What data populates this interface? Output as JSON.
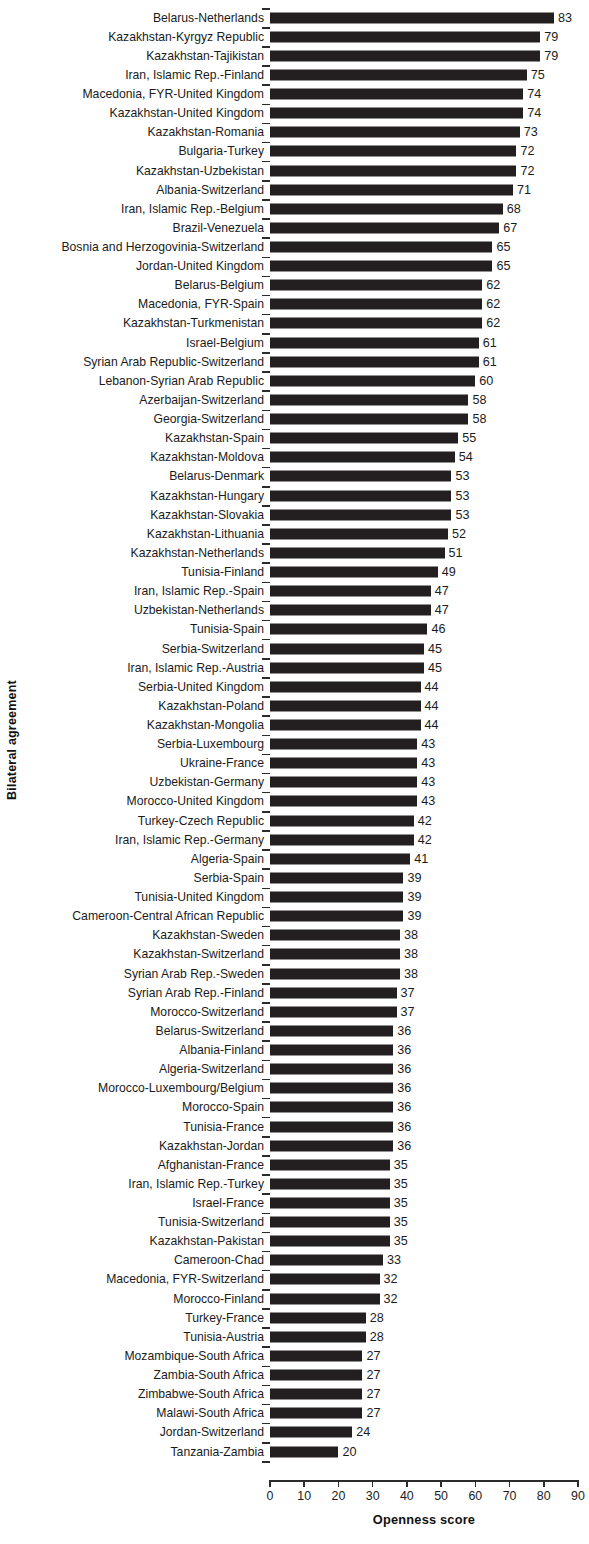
{
  "chart_data": {
    "type": "bar",
    "orientation": "horizontal",
    "title": "",
    "xlabel": "Openness score",
    "ylabel": "Bilateral agreement",
    "xlim": [
      0,
      90
    ],
    "xticks": [
      0,
      10,
      20,
      30,
      40,
      50,
      60,
      70,
      80,
      90
    ],
    "grid": false,
    "legend": null,
    "bar_color": "#231f20",
    "data_labels": true,
    "categories": [
      "Belarus-Netherlands",
      "Kazakhstan-Kyrgyz Republic",
      "Kazakhstan-Tajikistan",
      "Iran, Islamic Rep.-Finland",
      "Macedonia, FYR-United Kingdom",
      "Kazakhstan-United Kingdom",
      "Kazakhstan-Romania",
      "Bulgaria-Turkey",
      "Kazakhstan-Uzbekistan",
      "Albania-Switzerland",
      "Iran, Islamic Rep.-Belgium",
      "Brazil-Venezuela",
      "Bosnia and Herzogovinia-Switzerland",
      "Jordan-United Kingdom",
      "Belarus-Belgium",
      "Macedonia, FYR-Spain",
      "Kazakhstan-Turkmenistan",
      "Israel-Belgium",
      "Syrian Arab Republic-Switzerland",
      "Lebanon-Syrian Arab Republic",
      "Azerbaijan-Switzerland",
      "Georgia-Switzerland",
      "Kazakhstan-Spain",
      "Kazakhstan-Moldova",
      "Belarus-Denmark",
      "Kazakhstan-Hungary",
      "Kazakhstan-Slovakia",
      "Kazakhstan-Lithuania",
      "Kazakhstan-Netherlands",
      "Tunisia-Finland",
      "Iran, Islamic Rep.-Spain",
      "Uzbekistan-Netherlands",
      "Tunisia-Spain",
      "Serbia-Switzerland",
      "Iran, Islamic Rep.-Austria",
      "Serbia-United Kingdom",
      "Kazakhstan-Poland",
      "Kazakhstan-Mongolia",
      "Serbia-Luxembourg",
      "Ukraine-France",
      "Uzbekistan-Germany",
      "Morocco-United Kingdom",
      "Turkey-Czech Republic",
      "Iran, Islamic Rep.-Germany",
      "Algeria-Spain",
      "Serbia-Spain",
      "Tunisia-United Kingdom",
      "Cameroon-Central African Republic",
      "Kazakhstan-Sweden",
      "Kazakhstan-Switzerland",
      "Syrian Arab Rep.-Sweden",
      "Syrian Arab Rep.-Finland",
      "Morocco-Switzerland",
      "Belarus-Switzerland",
      "Albania-Finland",
      "Algeria-Switzerland",
      "Morocco-Luxembourg/Belgium",
      "Morocco-Spain",
      "Tunisia-France",
      "Kazakhstan-Jordan",
      "Afghanistan-France",
      "Iran, Islamic Rep.-Turkey",
      "Israel-France",
      "Tunisia-Switzerland",
      "Kazakhstan-Pakistan",
      "Cameroon-Chad",
      "Macedonia, FYR-Switzerland",
      "Morocco-Finland",
      "Turkey-France",
      "Tunisia-Austria",
      "Mozambique-South Africa",
      "Zambia-South Africa",
      "Zimbabwe-South Africa",
      "Malawi-South Africa",
      "Jordan-Switzerland",
      "Tanzania-Zambia"
    ],
    "values": [
      83,
      79,
      79,
      75,
      74,
      74,
      73,
      72,
      72,
      71,
      68,
      67,
      65,
      65,
      62,
      62,
      62,
      61,
      61,
      60,
      58,
      58,
      55,
      54,
      53,
      53,
      53,
      52,
      51,
      49,
      47,
      47,
      46,
      45,
      45,
      44,
      44,
      44,
      43,
      43,
      43,
      43,
      42,
      42,
      41,
      39,
      39,
      39,
      38,
      38,
      38,
      37,
      37,
      36,
      36,
      36,
      36,
      36,
      36,
      36,
      35,
      35,
      35,
      35,
      35,
      33,
      32,
      32,
      28,
      28,
      27,
      27,
      27,
      27,
      24,
      20
    ]
  }
}
